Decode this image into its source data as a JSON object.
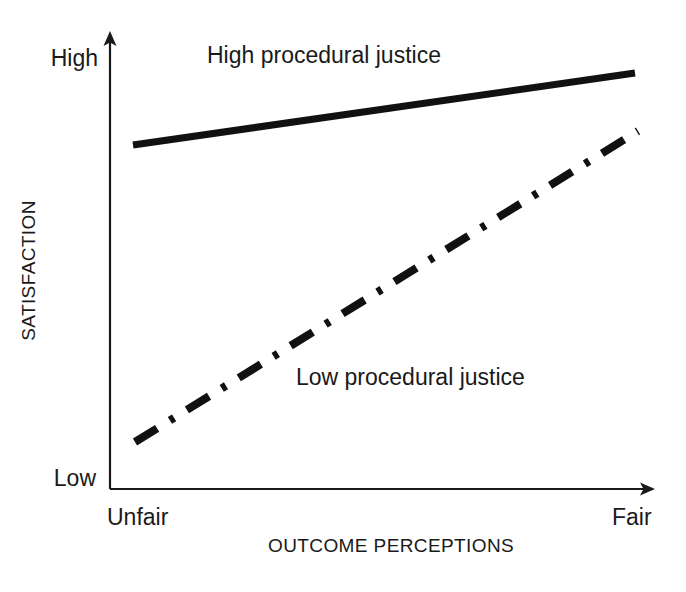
{
  "chart_data": {
    "type": "line",
    "title": "",
    "subtitle": "",
    "xlabel": "OUTCOME PERCEPTIONS",
    "ylabel": "SATISFACTION",
    "x_tick_labels": [
      "Unfair",
      "Fair"
    ],
    "y_tick_labels": [
      "Low",
      "High"
    ],
    "xlim": [
      0,
      1
    ],
    "ylim": [
      0,
      1
    ],
    "grid": false,
    "legend_position": "inline-annotations",
    "axis_style": "two-spine-with-arrowheads",
    "annotations": [
      {
        "text": "High procedural justice",
        "x": 0.19,
        "y": 0.96
      },
      {
        "text": "Low procedural justice",
        "x": 0.36,
        "y": 0.28
      }
    ],
    "series": [
      {
        "name": "High procedural justice",
        "style": "solid",
        "color": "#111111",
        "width": 7,
        "x": [
          0.04,
          1.0
        ],
        "values": [
          0.755,
          0.913
        ],
        "points_px": [
          [
            133,
            145
          ],
          [
            635,
            73
          ]
        ]
      },
      {
        "name": "Low procedural justice",
        "style": "dash-dot",
        "color": "#111111",
        "width": 8,
        "x": [
          0.05,
          1.0
        ],
        "values": [
          0.103,
          0.785
        ],
        "points_px": [
          [
            135,
            442
          ],
          [
            638,
            131
          ]
        ]
      }
    ]
  },
  "axes": {
    "y": {
      "high_label": "High",
      "low_label": "Low",
      "title": "SATISFACTION"
    },
    "x": {
      "left_label": "Unfair",
      "right_label": "Fair",
      "title": "OUTCOME PERCEPTIONS"
    }
  },
  "series_labels": {
    "high": "High procedural justice",
    "low": "Low procedural justice"
  },
  "colors": {
    "ink": "#111111",
    "text": "#1a1a1a",
    "background": "#ffffff"
  }
}
